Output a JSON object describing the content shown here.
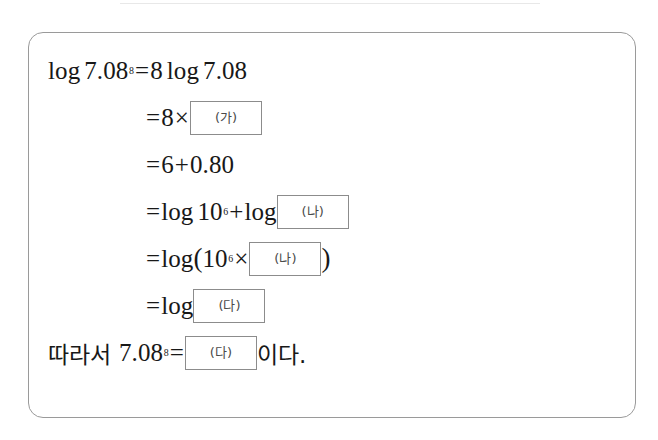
{
  "document": {
    "type": "math-worksheet-problem",
    "language": "ko",
    "border_color": "#9a9a9a",
    "box_border_color": "#8c8c8c",
    "text_color": "#181818",
    "background": "#ffffff"
  },
  "blanks": {
    "ga": "(가)",
    "na": "(나)",
    "da": "(다)"
  },
  "derivation": {
    "line1": {
      "lhs_log": "log",
      "lhs_base": "7.08",
      "lhs_exponent": "8",
      "equals": "=",
      "rhs_coefficient": "8",
      "rhs_log": "log",
      "rhs_value": "7.08"
    },
    "line2": {
      "equals": "=",
      "coefficient": "8",
      "times": "×",
      "blank": "(가)"
    },
    "line3": {
      "equals": "=",
      "term1": "6",
      "plus": "+",
      "term2": "0.80"
    },
    "line4": {
      "equals": "=",
      "log1": "log",
      "base1": "10",
      "exponent1": "6",
      "plus": "+",
      "log2": "log",
      "blank": "(나)"
    },
    "line5": {
      "equals": "=",
      "log": "log",
      "open_paren": "(",
      "base": "10",
      "exponent": "6",
      "times": "×",
      "blank": "(나)",
      "close_paren": ")"
    },
    "line6": {
      "equals": "=",
      "log": "log",
      "blank": "(다)"
    },
    "line7": {
      "prefix": "따라서",
      "base": "7.08",
      "exponent": "8",
      "equals": "=",
      "blank": "(다)",
      "suffix": "이다."
    }
  }
}
